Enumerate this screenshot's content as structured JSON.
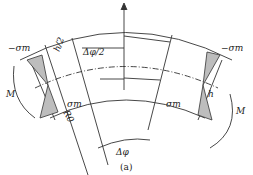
{
  "figure": {
    "caption": "(a)",
    "labels": {
      "neg_sigma_left": "−σm",
      "neg_sigma_right": "−σm",
      "sigma_left": "σm",
      "sigma_right": "σm",
      "half_angle": "Δφ/2",
      "angle": "Δφ",
      "h_left": "h/2",
      "h_right": "h",
      "radius": "R0",
      "moment_left": "M",
      "moment_right": "M"
    },
    "colors": {
      "line": "#333333",
      "fill": "#bdbdbd"
    }
  }
}
